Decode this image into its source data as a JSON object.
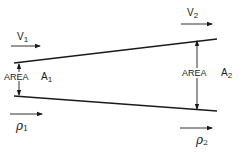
{
  "diagram": {
    "title": "",
    "inlet": {
      "velocity_label": "V",
      "velocity_sub": "1",
      "area_label": "AREA",
      "area_symbol": "A",
      "area_sub": "1",
      "density_label": "ρ",
      "density_sub": "1"
    },
    "outlet": {
      "velocity_label": "V",
      "velocity_sub": "2",
      "area_label": "AREA",
      "area_symbol": "A",
      "area_sub": "2",
      "density_label": "ρ",
      "density_sub": "2"
    },
    "colors": {
      "ink": "#1a1a1a",
      "background": "#ffffff"
    }
  }
}
